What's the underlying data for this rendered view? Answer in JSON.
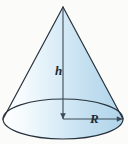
{
  "figure": {
    "name": "cone-diagram",
    "background_color": "#fbfbfa",
    "outline_color": "#28323c",
    "fill_light": "#ffffff",
    "fill_mid": "#dbecf7",
    "fill_dark": "#b3d6ec",
    "base_fill_dark": "#a8d0e8",
    "dimension_line_color": "#3c4a55"
  },
  "labels": {
    "height": "h",
    "radius": "R"
  },
  "geometry": {
    "apex_x": 63,
    "apex_y": 7,
    "base_center_x": 63,
    "base_center_y": 119,
    "base_rx": 60,
    "base_ry": 20,
    "height_line": {
      "x1": 63,
      "y1": 7,
      "x2": 63,
      "y2": 119
    },
    "radius_line": {
      "x1": 63,
      "y1": 119,
      "x2": 123,
      "y2": 119
    }
  }
}
